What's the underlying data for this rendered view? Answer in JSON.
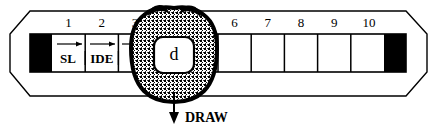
{
  "figure": {
    "type": "tape-diagram",
    "background_color": "#ffffff",
    "ink_color": "#000000",
    "blob_fill_color": "#8a8a8a",
    "blob_outline_color": "#000000"
  },
  "tape": {
    "name": "numbered-tape",
    "cell_count": 10,
    "cell_numbers": [
      "1",
      "2",
      "3",
      "4",
      "5",
      "6",
      "7",
      "8",
      "9",
      "10"
    ],
    "left_end_filled": true,
    "right_end_filled": true
  },
  "segments": [
    {
      "label": "SL",
      "spans_cells": "1"
    },
    {
      "label": "IDE",
      "spans_cells": "2"
    }
  ],
  "blob": {
    "name": "highlight-blob",
    "covers_cells": [
      "4"
    ],
    "token_label": "d"
  },
  "callout": {
    "label": "DRAW",
    "arrow_direction": "down"
  }
}
